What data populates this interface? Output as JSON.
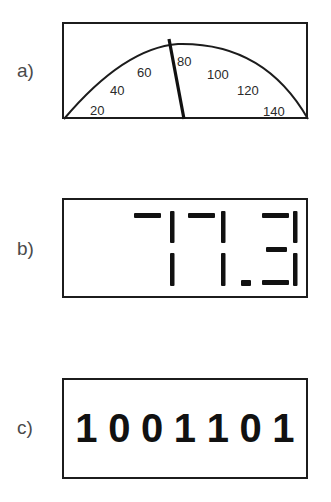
{
  "panels": [
    {
      "label": "a)",
      "type": "analog-gauge",
      "scale_labels": [
        "20",
        "40",
        "60",
        "80",
        "100",
        "120",
        "140"
      ],
      "needle_value": 77.3
    },
    {
      "label": "b)",
      "type": "seven-segment-display",
      "reading": "77.3"
    },
    {
      "label": "c)",
      "type": "binary-display",
      "reading": "1001101",
      "digits": [
        "1",
        "0",
        "0",
        "1",
        "1",
        "0",
        "1"
      ]
    }
  ],
  "colors": {
    "stroke": "#1c1c1c",
    "label": "#4a4a4a",
    "background": "#ffffff"
  }
}
